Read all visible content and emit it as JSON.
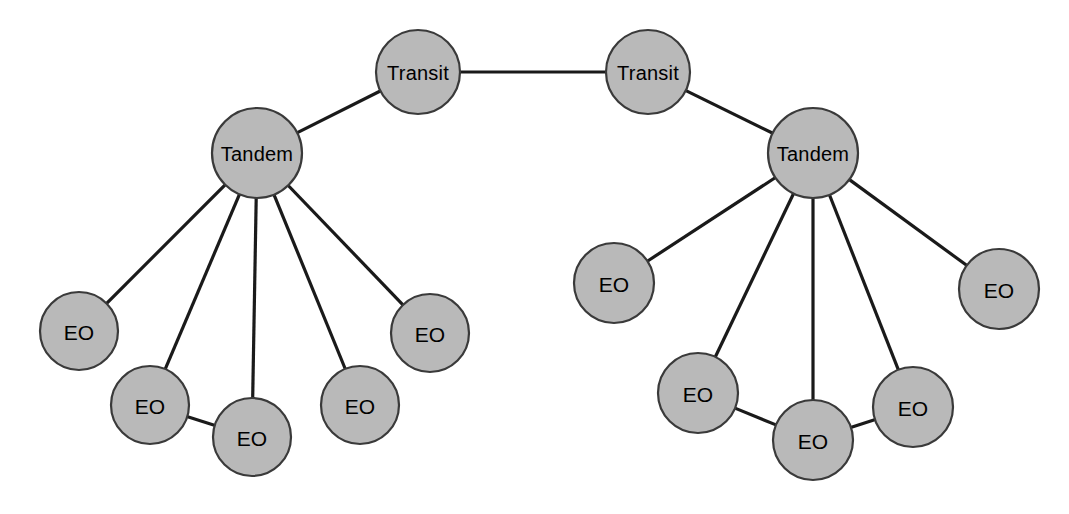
{
  "diagram": {
    "type": "network-topology",
    "canvas": {
      "width": 1069,
      "height": 514,
      "background": "#ffffff"
    },
    "style": {
      "node_fill": "#b9b9b9",
      "node_stroke": "#3a3a3a",
      "node_stroke_width": 2.2,
      "link_color": "#1a1a1a",
      "link_width": 3.2,
      "label_color": "#000000"
    },
    "nodes": [
      {
        "id": "transit-left",
        "label": "Transit",
        "kind": "transit",
        "cx": 418,
        "cy": 72,
        "r": 42
      },
      {
        "id": "transit-right",
        "label": "Transit",
        "kind": "transit",
        "cx": 648,
        "cy": 72,
        "r": 42
      },
      {
        "id": "tandem-left",
        "label": "Tandem",
        "kind": "tandem",
        "cx": 257,
        "cy": 153,
        "r": 45
      },
      {
        "id": "tandem-right",
        "label": "Tandem",
        "kind": "tandem",
        "cx": 813,
        "cy": 153,
        "r": 45
      },
      {
        "id": "eo-l1",
        "label": "EO",
        "kind": "eo",
        "cx": 79,
        "cy": 331,
        "r": 39
      },
      {
        "id": "eo-l2",
        "label": "EO",
        "kind": "eo",
        "cx": 150,
        "cy": 405,
        "r": 39
      },
      {
        "id": "eo-l3",
        "label": "EO",
        "kind": "eo",
        "cx": 252,
        "cy": 437,
        "r": 39
      },
      {
        "id": "eo-l4",
        "label": "EO",
        "kind": "eo",
        "cx": 360,
        "cy": 405,
        "r": 39
      },
      {
        "id": "eo-l5",
        "label": "EO",
        "kind": "eo",
        "cx": 430,
        "cy": 333,
        "r": 39
      },
      {
        "id": "eo-r1",
        "label": "EO",
        "kind": "eo",
        "cx": 614,
        "cy": 283,
        "r": 40
      },
      {
        "id": "eo-r2",
        "label": "EO",
        "kind": "eo",
        "cx": 698,
        "cy": 393,
        "r": 40
      },
      {
        "id": "eo-r3",
        "label": "EO",
        "kind": "eo",
        "cx": 813,
        "cy": 440,
        "r": 40
      },
      {
        "id": "eo-r4",
        "label": "EO",
        "kind": "eo",
        "cx": 913,
        "cy": 407,
        "r": 40
      },
      {
        "id": "eo-r5",
        "label": "EO",
        "kind": "eo",
        "cx": 999,
        "cy": 289,
        "r": 40
      }
    ],
    "links": [
      {
        "id": "link-transit-backbone",
        "from": "transit-left",
        "to": "transit-right"
      },
      {
        "id": "link-tl-trl",
        "from": "tandem-left",
        "to": "transit-left"
      },
      {
        "id": "link-tr-trr",
        "from": "tandem-right",
        "to": "transit-right"
      },
      {
        "id": "link-tl-eol1",
        "from": "tandem-left",
        "to": "eo-l1"
      },
      {
        "id": "link-tl-eol2",
        "from": "tandem-left",
        "to": "eo-l2"
      },
      {
        "id": "link-tl-eol3",
        "from": "tandem-left",
        "to": "eo-l3"
      },
      {
        "id": "link-tl-eol4",
        "from": "tandem-left",
        "to": "eo-l4"
      },
      {
        "id": "link-tl-eol5",
        "from": "tandem-left",
        "to": "eo-l5"
      },
      {
        "id": "link-eol2-eol3",
        "from": "eo-l2",
        "to": "eo-l3"
      },
      {
        "id": "link-tr-eor1",
        "from": "tandem-right",
        "to": "eo-r1"
      },
      {
        "id": "link-tr-eor2",
        "from": "tandem-right",
        "to": "eo-r2"
      },
      {
        "id": "link-tr-eor3",
        "from": "tandem-right",
        "to": "eo-r3"
      },
      {
        "id": "link-tr-eor4",
        "from": "tandem-right",
        "to": "eo-r4"
      },
      {
        "id": "link-tr-eor5",
        "from": "tandem-right",
        "to": "eo-r5"
      },
      {
        "id": "link-eor2-eor3",
        "from": "eo-r2",
        "to": "eo-r3"
      },
      {
        "id": "link-eor3-eor4",
        "from": "eo-r3",
        "to": "eo-r4"
      }
    ]
  }
}
